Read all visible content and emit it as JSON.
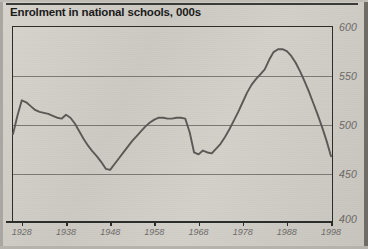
{
  "figure": {
    "title": "Enrolment in national schools, 000s",
    "background_color": "#cfccc6",
    "frame_color": "#2c2c2a",
    "line_color": "#5b5955",
    "grid_color": "#6c6a66",
    "label_color": "#6a6864"
  },
  "chart_data": {
    "type": "line",
    "title": "Enrolment in national schools, 000s",
    "xlabel": "",
    "ylabel": "",
    "units": "thousands",
    "xlim": [
      1926,
      1998
    ],
    "ylim": [
      400,
      600
    ],
    "ytick_labels": [
      "600",
      "550",
      "500",
      "450",
      "400"
    ],
    "yticks": [
      600,
      550,
      500,
      450,
      400
    ],
    "xtick_labels": [
      "1928",
      "1938",
      "1948",
      "1958",
      "1968",
      "1978",
      "1988",
      "1998"
    ],
    "xticks": [
      1928,
      1938,
      1948,
      1958,
      1968,
      1978,
      1988,
      1998
    ],
    "grid": "horizontal",
    "legend": "none",
    "series": [
      {
        "name": "Enrolment in national schools",
        "x": [
          1926,
          1927,
          1928,
          1929,
          1930,
          1931,
          1932,
          1933,
          1934,
          1935,
          1936,
          1937,
          1938,
          1939,
          1940,
          1941,
          1942,
          1943,
          1944,
          1945,
          1946,
          1947,
          1948,
          1949,
          1950,
          1951,
          1952,
          1953,
          1954,
          1955,
          1956,
          1957,
          1958,
          1959,
          1960,
          1961,
          1962,
          1963,
          1964,
          1965,
          1966,
          1967,
          1968,
          1969,
          1970,
          1971,
          1972,
          1973,
          1974,
          1975,
          1976,
          1977,
          1978,
          1979,
          1980,
          1981,
          1982,
          1983,
          1984,
          1985,
          1986,
          1987,
          1988,
          1989,
          1990,
          1991,
          1992,
          1993,
          1994,
          1995,
          1996,
          1997,
          1998
        ],
        "values": [
          489,
          508,
          524,
          522,
          518,
          514,
          512,
          511,
          510,
          508,
          506,
          505,
          509,
          506,
          500,
          492,
          484,
          477,
          471,
          466,
          460,
          453,
          452,
          458,
          464,
          470,
          476,
          482,
          487,
          492,
          497,
          501,
          504,
          506,
          506,
          505,
          505,
          506,
          506,
          505,
          491,
          470,
          468,
          472,
          470,
          469,
          474,
          479,
          486,
          494,
          503,
          512,
          522,
          532,
          540,
          546,
          551,
          556,
          566,
          574,
          577,
          577,
          575,
          570,
          563,
          554,
          544,
          533,
          521,
          509,
          496,
          482,
          466
        ]
      }
    ]
  }
}
